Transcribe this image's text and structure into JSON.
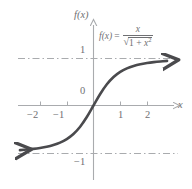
{
  "chart_data": {
    "type": "line",
    "title": "",
    "equation_display": "f(x) = x / sqrt(1 + x^2)",
    "equation": {
      "lhs": "f(x)",
      "equals": "=",
      "numerator": "x",
      "denominator_radicand_a": "1 + ",
      "denominator_radicand_x": "x",
      "denominator_exponent": "2",
      "radical_sign": "√"
    },
    "xlabel": "x",
    "ylabel": "f(x)",
    "xlim": [
      -2.9,
      2.9
    ],
    "ylim": [
      -1.55,
      1.55
    ],
    "xticks": [
      -2,
      -1,
      1,
      2
    ],
    "xtick_labels": [
      "−2",
      "−1",
      "1",
      "2"
    ],
    "yticks": [
      1
    ],
    "ytick_labels": [
      "1"
    ],
    "origin_label": "0",
    "lower_label": "−1",
    "grid": false,
    "legend": false,
    "asymptotes": [
      {
        "name": "upper-asymptote",
        "y": 1,
        "style": "dash-dot",
        "label": "1"
      },
      {
        "name": "lower-asymptote",
        "y": -1,
        "style": "dash-dot",
        "label": "−1"
      }
    ],
    "series": [
      {
        "name": "f(x) = x / sqrt(1 + x^2)",
        "arrow_start": "left",
        "arrow_end": "right",
        "x": [
          -2.75,
          -2.5,
          -2.25,
          -2,
          -1.75,
          -1.5,
          -1.25,
          -1,
          -0.75,
          -0.5,
          -0.25,
          0,
          0.25,
          0.5,
          0.75,
          1,
          1.25,
          1.5,
          1.75,
          2,
          2.25,
          2.5,
          2.75
        ],
        "y": [
          -0.94,
          -0.928,
          -0.913,
          -0.894,
          -0.869,
          -0.832,
          -0.781,
          -0.707,
          -0.6,
          -0.447,
          -0.243,
          0,
          0.243,
          0.447,
          0.6,
          0.707,
          0.781,
          0.832,
          0.869,
          0.894,
          0.913,
          0.928,
          0.94
        ]
      }
    ],
    "colors": {
      "curve": "#4a4a4d",
      "axis": "#a9abae",
      "asymptote": "#a9abae",
      "text": "#6f7073",
      "background": "#ffffff"
    }
  }
}
